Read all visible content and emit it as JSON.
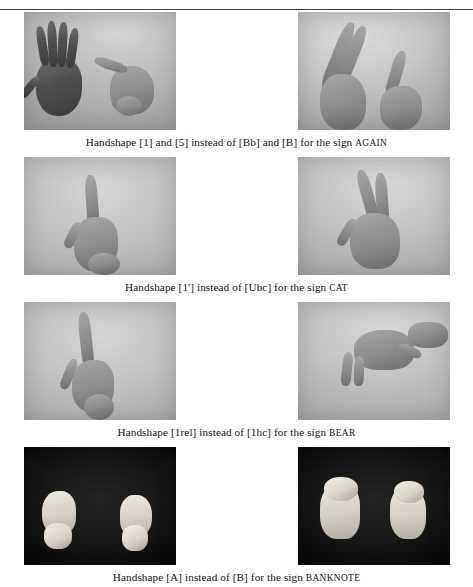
{
  "page": {
    "running_head": "",
    "width": 473,
    "height": 578,
    "background": "#ffffff",
    "rule_color": "#3a3a3a"
  },
  "figure": {
    "rows": [
      {
        "id": "row-again",
        "caption_prefix": "Handshape [1] and [5] instead of  [Bb] and [B] for the sign ",
        "caption_sign": "AGAIN",
        "photos": [
          {
            "id": "photo-again-left",
            "alt": "Two hands: open flat hand with fingers spread beside a bent index finger hand against grey backdrop",
            "background": "#b0b0b0"
          },
          {
            "id": "photo-again-right",
            "alt": "Two hands: index and middle fingers extended upward meeting a second angled hand against grey backdrop",
            "background": "#bcbcbc"
          }
        ]
      },
      {
        "id": "row-cat",
        "caption_prefix": "Handshape  [1'] instead of  [Ubc] for the sign ",
        "caption_sign": "CAT",
        "photos": [
          {
            "id": "photo-cat-left",
            "alt": "Hand with index finger extended upward, thumb tucked, against grey backdrop",
            "background": "#b4b4b4"
          },
          {
            "id": "photo-cat-right",
            "alt": "Hand with index and middle finger extended in a V shape against grey backdrop",
            "background": "#bdbdbd"
          }
        ]
      },
      {
        "id": "row-bear",
        "caption_prefix": "Handshape [1rel] instead of  [1hc] for the sign ",
        "caption_sign": "BEAR",
        "photos": [
          {
            "id": "photo-bear-left",
            "alt": "Hand with index finger extended upward and curved thumb against grey backdrop",
            "background": "#b6b6b6"
          },
          {
            "id": "photo-bear-right",
            "alt": "Hand in claw shape with fingers bent downward against grey backdrop",
            "background": "#b8b8b8"
          }
        ]
      },
      {
        "id": "row-banknote",
        "caption_prefix": "Handshape [A] instead of [B] for the sign ",
        "caption_sign": "BANKNOTE",
        "photos": [
          {
            "id": "photo-banknote-left",
            "alt": "Two closed fists side by side against a black background",
            "background": "#0a0a0a"
          },
          {
            "id": "photo-banknote-right",
            "alt": "Two flat hands with fingers together held downward against a black background",
            "background": "#0a0a0a"
          }
        ]
      }
    ]
  }
}
